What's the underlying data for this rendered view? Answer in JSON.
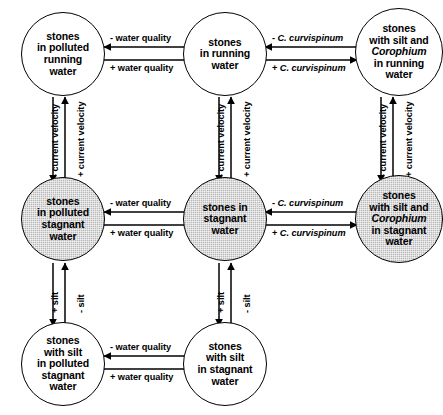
{
  "diagram": {
    "nodes": [
      {
        "id": "stones-in-polluted-running-water",
        "label": "stones in polluted running water",
        "lines": [
          "stones",
          "in polluted",
          "running",
          "water"
        ],
        "fill": "white",
        "row": "running",
        "column": "polluted"
      },
      {
        "id": "stones-in-running-water",
        "label": "stones in running water",
        "lines": [
          "stones",
          "in running",
          "water"
        ],
        "fill": "white",
        "row": "running",
        "column": "clean"
      },
      {
        "id": "stones-with-silt-and-corophium-in-running-water",
        "label": "stones with silt and Corophium in running water",
        "lines": [
          "stones",
          "with silt and",
          "Corophium",
          "in running",
          "water"
        ],
        "italic_lines": [
          "Corophium"
        ],
        "fill": "white",
        "row": "running",
        "column": "silt-corophium"
      },
      {
        "id": "stones-in-polluted-stagnant-water",
        "label": "stones in polluted stagnant water",
        "lines": [
          "stones",
          "in polluted",
          "stagnant",
          "water"
        ],
        "fill": "shaded",
        "row": "stagnant",
        "column": "polluted"
      },
      {
        "id": "stones-in-stagnant-water",
        "label": "stones in stagnant water",
        "lines": [
          "stones in",
          "stagnant",
          "water"
        ],
        "fill": "shaded",
        "row": "stagnant",
        "column": "clean"
      },
      {
        "id": "stones-with-silt-and-corophium-in-stagnant-water",
        "label": "stones with silt and Corophium in stagnant water",
        "lines": [
          "stones",
          "with silt and",
          "Corophium",
          "in stagnant",
          "water"
        ],
        "italic_lines": [
          "Corophium"
        ],
        "fill": "shaded",
        "row": "stagnant",
        "column": "silt-corophium"
      },
      {
        "id": "stones-with-silt-in-polluted-stagnant-water",
        "label": "stones with silt in polluted stagnant water",
        "lines": [
          "stones",
          "with silt",
          "in polluted",
          "stagnant",
          "water"
        ],
        "fill": "white",
        "row": "silted",
        "column": "polluted"
      },
      {
        "id": "stones-with-silt-in-stagnant-water",
        "label": "stones with silt in stagnant water",
        "lines": [
          "stones",
          "with silt",
          "in stagnant",
          "water"
        ],
        "fill": "white",
        "row": "silted",
        "column": "clean"
      }
    ],
    "edge_labels": {
      "water_quality_minus": "- water quality",
      "water_quality_plus": "+ water quality",
      "curvispinum_minus_prefix": "- ",
      "curvispinum_plus_prefix": "+ ",
      "curvispinum_name": "C. curvispinum",
      "current_velocity_minus": "- current velocity",
      "current_velocity_plus": "+ current velocity",
      "silt_plus": "+ silt",
      "silt_minus": "- silt"
    },
    "colors": {
      "stroke": "#000000",
      "node_fill_white": "#ffffff",
      "node_fill_shaded": "#b9b9b9",
      "background": "#ffffff",
      "text": "#000000"
    }
  }
}
